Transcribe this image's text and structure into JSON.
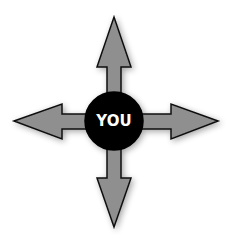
{
  "diagram": {
    "center_label": "YOU",
    "center_color": "#000000",
    "label_color": "#ffffff",
    "arrow_fill": "#8f8f8f",
    "arrow_stroke": "#111111",
    "arrows": [
      {
        "direction": "up"
      },
      {
        "direction": "down"
      },
      {
        "direction": "left"
      },
      {
        "direction": "right"
      }
    ]
  }
}
